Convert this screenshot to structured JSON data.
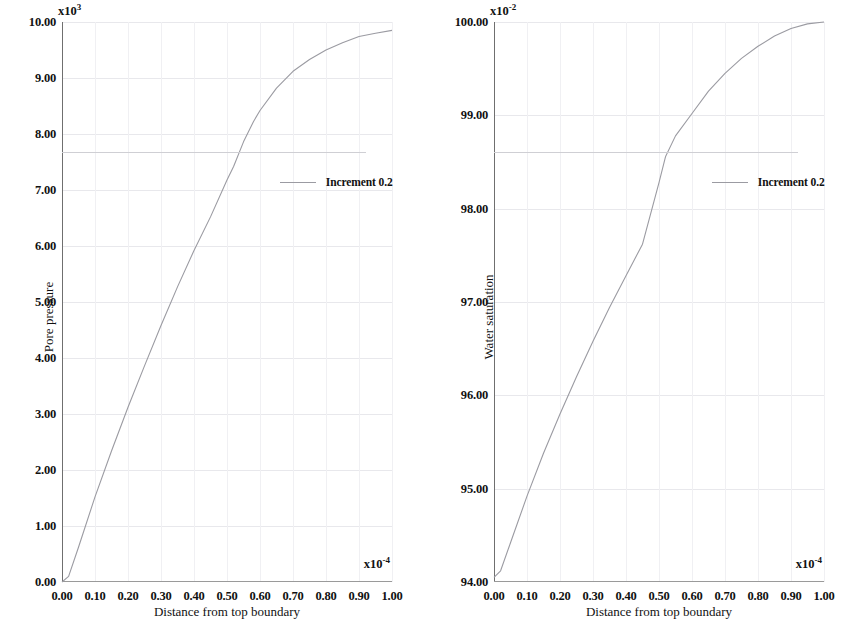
{
  "figure": {
    "background": "#ffffff",
    "curve_color": "#9b9ba2",
    "grid_color": "#e8e8ec",
    "axis_color": "#6f6f6f"
  },
  "panels": [
    {
      "id": "pore-pressure",
      "y_axis": {
        "title": "Pore pressure",
        "multiplier_base": "x10",
        "multiplier_exponent": "3",
        "min": 0.0,
        "max": 10.0,
        "ticks": [
          "0.00",
          "1.00",
          "2.00",
          "3.00",
          "4.00",
          "5.00",
          "6.00",
          "7.00",
          "8.00",
          "9.00",
          "10.00"
        ],
        "tick_values": [
          0,
          1,
          2,
          3,
          4,
          5,
          6,
          7,
          8,
          9,
          10
        ]
      },
      "x_axis": {
        "title": "Distance from top boundary",
        "multiplier_base": "x10",
        "multiplier_exponent": "-4",
        "min": 0.0,
        "max": 1.0,
        "ticks": [
          "0.00",
          "0.10",
          "0.20",
          "0.30",
          "0.40",
          "0.50",
          "0.60",
          "0.70",
          "0.80",
          "0.90",
          "1.00"
        ],
        "tick_values": [
          0.0,
          0.1,
          0.2,
          0.3,
          0.4,
          0.5,
          0.6,
          0.7,
          0.8,
          0.9,
          1.0
        ]
      },
      "legend": {
        "label": "Increment 0.2"
      }
    },
    {
      "id": "water-saturation",
      "y_axis": {
        "title": "Water saturation",
        "multiplier_base": "x10",
        "multiplier_exponent": "-2",
        "min": 94.0,
        "max": 100.0,
        "ticks": [
          "94.00",
          "95.00",
          "96.00",
          "97.00",
          "98.00",
          "99.00",
          "100.00"
        ],
        "tick_values": [
          94,
          95,
          96,
          97,
          98,
          99,
          100
        ]
      },
      "x_axis": {
        "title": "Distance from top boundary",
        "multiplier_base": "x10",
        "multiplier_exponent": "-4",
        "min": 0.0,
        "max": 1.0,
        "ticks": [
          "0.00",
          "0.10",
          "0.20",
          "0.30",
          "0.40",
          "0.50",
          "0.60",
          "0.70",
          "0.80",
          "0.90",
          "1.00"
        ],
        "tick_values": [
          0.0,
          0.1,
          0.2,
          0.3,
          0.4,
          0.5,
          0.6,
          0.7,
          0.8,
          0.9,
          1.0
        ]
      },
      "legend": {
        "label": "Increment 0.2"
      }
    }
  ],
  "chart_data": [
    {
      "type": "line",
      "title": "",
      "xlabel": "Distance from top boundary",
      "ylabel": "Pore pressure",
      "x_multiplier": "x10^-4",
      "y_multiplier": "x10^3",
      "xlim": [
        0.0,
        1.0
      ],
      "ylim": [
        0.0,
        10.0
      ],
      "grid": true,
      "legend_position": "center",
      "series": [
        {
          "name": "Increment 0.2",
          "color": "#9b9ba2",
          "x": [
            0.0,
            0.02,
            0.05,
            0.1,
            0.15,
            0.2,
            0.25,
            0.3,
            0.35,
            0.4,
            0.45,
            0.5,
            0.52,
            0.55,
            0.58,
            0.6,
            0.65,
            0.7,
            0.75,
            0.8,
            0.85,
            0.9,
            0.95,
            1.0
          ],
          "y": [
            0.0,
            0.1,
            0.62,
            1.52,
            2.34,
            3.12,
            3.86,
            4.58,
            5.27,
            5.92,
            6.52,
            7.18,
            7.42,
            7.86,
            8.22,
            8.42,
            8.82,
            9.12,
            9.33,
            9.5,
            9.63,
            9.74,
            9.8,
            9.85
          ]
        }
      ]
    },
    {
      "type": "line",
      "title": "",
      "xlabel": "Distance from top boundary",
      "ylabel": "Water saturation",
      "x_multiplier": "x10^-4",
      "y_multiplier": "x10^-2",
      "xlim": [
        0.0,
        1.0
      ],
      "ylim": [
        94.0,
        100.0
      ],
      "grid": true,
      "legend_position": "center",
      "series": [
        {
          "name": "Increment 0.2",
          "color": "#9b9ba2",
          "x": [
            0.0,
            0.02,
            0.05,
            0.1,
            0.15,
            0.2,
            0.25,
            0.3,
            0.35,
            0.4,
            0.45,
            0.5,
            0.52,
            0.55,
            0.6,
            0.65,
            0.7,
            0.75,
            0.8,
            0.85,
            0.9,
            0.95,
            1.0
          ],
          "y": [
            94.05,
            94.12,
            94.42,
            94.92,
            95.38,
            95.8,
            96.2,
            96.58,
            96.94,
            97.28,
            97.62,
            98.28,
            98.56,
            98.78,
            99.02,
            99.26,
            99.45,
            99.61,
            99.74,
            99.85,
            99.93,
            99.98,
            100.0
          ]
        }
      ]
    }
  ]
}
